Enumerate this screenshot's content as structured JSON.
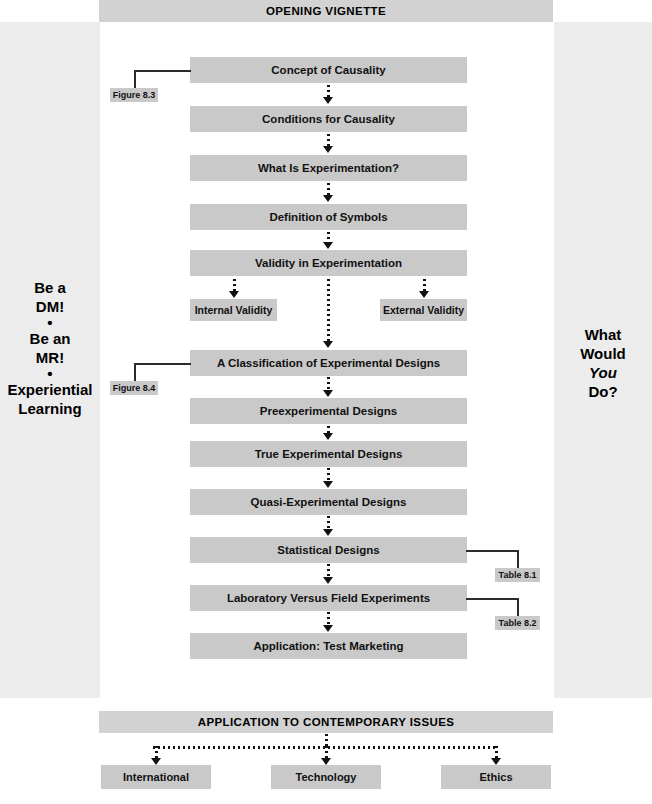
{
  "banners": {
    "top": "OPENING VIGNETTE",
    "bottom": "APPLICATION TO CONTEMPORARY ISSUES"
  },
  "left_panel": {
    "lines": [
      "Be a",
      "DM!",
      "•",
      "Be an",
      "MR!",
      "•",
      "Experiential",
      "Learning"
    ]
  },
  "right_panel": {
    "line1": "What",
    "line2": "Would",
    "line3_italic": "You",
    "line4": "Do?"
  },
  "flow": {
    "main_steps": [
      "Concept of Causality",
      "Conditions for Causality",
      "What Is Experimentation?",
      "Definition of Symbols",
      "Validity in Experimentation",
      "A Classification of Experimental Designs",
      "Preexperimental Designs",
      "True Experimental Designs",
      "Quasi-Experimental Designs",
      "Statistical Designs",
      "Laboratory Versus Field Experiments",
      "Application: Test Marketing"
    ],
    "validity_branches": [
      "Internal Validity",
      "External Validity"
    ],
    "bottom_steps": [
      "International",
      "Technology",
      "Ethics"
    ]
  },
  "references": {
    "figure_8_3": "Figure 8.3",
    "figure_8_4": "Figure 8.4",
    "table_8_1": "Table 8.1",
    "table_8_2": "Table 8.2"
  },
  "colors": {
    "box_fill": "#c9c9c9",
    "banner_fill": "#d2d2d2",
    "panel_fill": "#ececec",
    "line": "#2b2b2b"
  }
}
